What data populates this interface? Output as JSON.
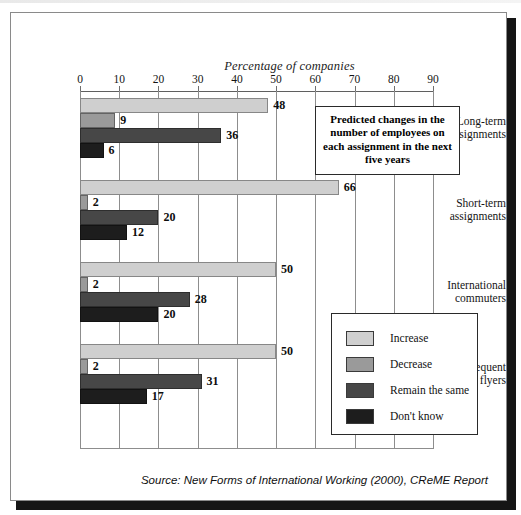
{
  "chart_data": {
    "type": "bar",
    "orientation": "horizontal",
    "title": "Percentage of companies",
    "xlabel": "Percentage of companies",
    "ylabel": "",
    "xlim": [
      0,
      90
    ],
    "xticks": [
      0,
      10,
      20,
      30,
      40,
      50,
      60,
      70,
      80,
      90
    ],
    "grid": true,
    "legend_position": "inside-right",
    "categories": [
      "Long-term assignments",
      "Short-term assignments",
      "International commuters",
      "Frequent flyers"
    ],
    "series": [
      {
        "name": "Increase",
        "color": "#cfcfcf",
        "values": [
          48,
          66,
          50,
          50
        ]
      },
      {
        "name": "Decrease",
        "color": "#9a9a9a",
        "values": [
          9,
          2,
          2,
          2
        ]
      },
      {
        "name": "Remain the same",
        "color": "#474747",
        "values": [
          36,
          20,
          28,
          31
        ]
      },
      {
        "name": "Don't know",
        "color": "#1d1d1d",
        "values": [
          6,
          12,
          20,
          17
        ]
      }
    ],
    "annotation": "Predicted changes in the number of employees on each assignment in the next five years",
    "source": "Source: New Forms of International Working (2000), CReME Report"
  },
  "legend": {
    "items": [
      {
        "label": "Increase",
        "color": "#cfcfcf"
      },
      {
        "label": "Decrease",
        "color": "#9a9a9a"
      },
      {
        "label": "Remain the same",
        "color": "#474747"
      },
      {
        "label": "Don't know",
        "color": "#1d1d1d"
      }
    ]
  }
}
